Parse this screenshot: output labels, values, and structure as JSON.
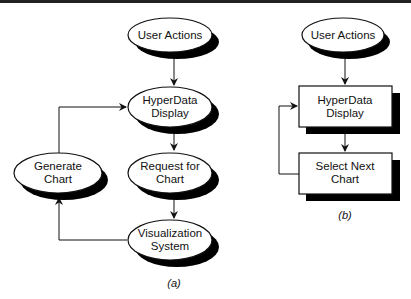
{
  "diagram_a": {
    "caption": "(a)",
    "nodes": {
      "user_actions": {
        "line1": "User Actions",
        "line2": ""
      },
      "hyperdata_display": {
        "line1": "HyperData",
        "line2": "Display"
      },
      "request_for_chart": {
        "line1": "Request for",
        "line2": "Chart"
      },
      "visualization_system": {
        "line1": "Visualization",
        "line2": "System"
      },
      "generate_chart": {
        "line1": "Generate",
        "line2": "Chart"
      }
    },
    "edges": [
      [
        "User Actions",
        "HyperData Display"
      ],
      [
        "HyperData Display",
        "Request for Chart"
      ],
      [
        "Request for Chart",
        "Visualization System"
      ],
      [
        "Visualization System",
        "Generate Chart"
      ],
      [
        "Generate Chart",
        "HyperData Display"
      ]
    ]
  },
  "diagram_b": {
    "caption": "(b)",
    "nodes": {
      "user_actions": {
        "line1": "User Actions"
      },
      "hyperdata_display": {
        "line1": "HyperData",
        "line2": "Display"
      },
      "select_next_chart": {
        "line1": "Select Next",
        "line2": "Chart"
      }
    },
    "edges": [
      [
        "User Actions",
        "HyperData Display"
      ],
      [
        "HyperData Display",
        "Select Next Chart"
      ],
      [
        "Select Next Chart",
        "HyperData Display"
      ]
    ]
  },
  "colors": {
    "stroke": "#111111",
    "shadow": "#000000",
    "fill": "#ffffff"
  }
}
